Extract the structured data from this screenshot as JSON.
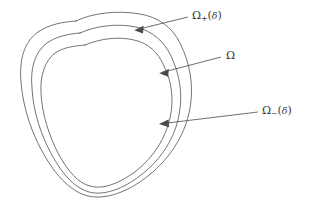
{
  "figure": {
    "type": "math-diagram",
    "background_color": "#ffffff",
    "curve_color": "#5a5a5a",
    "arrow_color": "#4a4a4a",
    "text_color": "#3a3a3a"
  },
  "labels": [
    {
      "id": "omega-plus",
      "base": "Ω",
      "subscript": "+",
      "argument": "δ",
      "full_text": "Ω₊(δ)",
      "target": "outer-curve"
    },
    {
      "id": "omega",
      "base": "Ω",
      "subscript": "",
      "argument": "",
      "full_text": "Ω",
      "target": "middle-curve"
    },
    {
      "id": "omega-minus",
      "base": "Ω",
      "subscript": "−",
      "argument": "δ",
      "full_text": "Ω₋(δ)",
      "target": "inner-curve"
    }
  ],
  "curves": [
    {
      "id": "outer-curve",
      "name": "Ω₊(δ) boundary"
    },
    {
      "id": "middle-curve",
      "name": "Ω boundary"
    },
    {
      "id": "inner-curve",
      "name": "Ω₋(δ) boundary"
    }
  ],
  "arrows": [
    {
      "id": "arrow-omega-plus",
      "from": [
        188,
        17
      ],
      "to": [
        135,
        30
      ]
    },
    {
      "id": "arrow-omega",
      "from": [
        221,
        57
      ],
      "to": [
        160,
        73
      ]
    },
    {
      "id": "arrow-omega-minus",
      "from": [
        258,
        112
      ],
      "to": [
        159,
        124
      ]
    }
  ]
}
